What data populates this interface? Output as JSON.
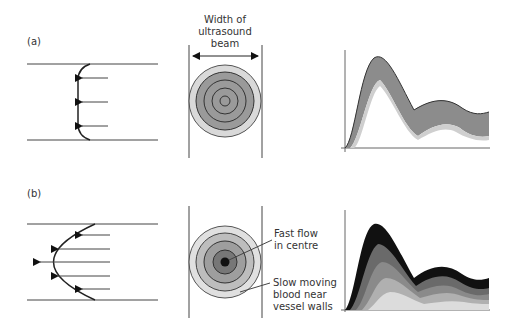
{
  "panels": {
    "a": {
      "label": "(a)",
      "profile": "plug flow",
      "beam_title_line1": "Width of",
      "beam_title_line2": "ultrasound",
      "beam_title_line3": "beam"
    },
    "b": {
      "label": "(b)",
      "profile": "parabolic (laminar) flow",
      "annotation_fast_line1": "Fast flow",
      "annotation_fast_line2": "in centre",
      "annotation_slow_line1": "Slow moving",
      "annotation_slow_line2": "blood near",
      "annotation_slow_line3": "vessel walls"
    }
  },
  "colors": {
    "line": "#444444",
    "ring_light": "#d9d9d9",
    "ring_mid": "#a0a0a0",
    "ring_dark": "#777777",
    "ring_core": "#111111",
    "spectrum_a": "#8c8c8c"
  }
}
